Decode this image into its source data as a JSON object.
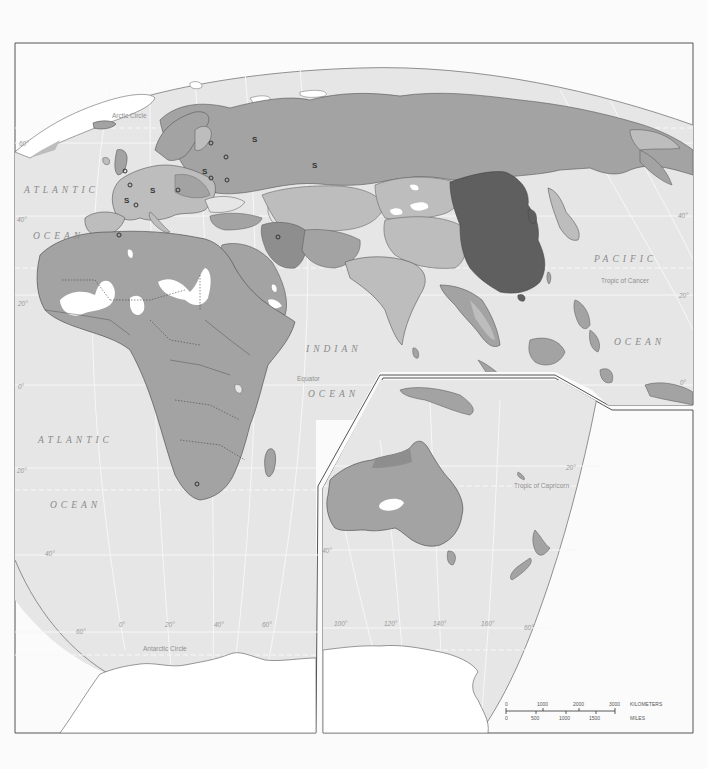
{
  "map": {
    "type": "thematic world map (Eastern Hemisphere, Europe/Africa/Asia/Australia)",
    "colors": {
      "page_bg": "#fbfbfb",
      "frame": "#555555",
      "ocean": "#e6e6e6",
      "graticule": "#f7f7f7",
      "land_light": "#bdbdbd",
      "land_medium": "#a3a3a3",
      "land_darker": "#8e8e8e",
      "land_darkest": "#5f5f5f",
      "ice": "#ffffff",
      "desert_blank": "#ffffff",
      "coast": "#555555"
    },
    "ocean_labels": [
      {
        "id": "atlantic-north-1",
        "text": "ATLANTIC"
      },
      {
        "id": "atlantic-north-2",
        "text": "OCEAN"
      },
      {
        "id": "atlantic-south-1",
        "text": "ATLANTIC"
      },
      {
        "id": "atlantic-south-2",
        "text": "OCEAN"
      },
      {
        "id": "indian-1",
        "text": "INDIAN"
      },
      {
        "id": "indian-2",
        "text": "OCEAN"
      },
      {
        "id": "pacific-1",
        "text": "PACIFIC"
      },
      {
        "id": "pacific-2",
        "text": "OCEAN"
      }
    ],
    "line_labels": {
      "arctic_circle": "Arctic Circle",
      "tropic_cancer": "Tropic of Cancer",
      "equator": "Equator",
      "tropic_capricorn": "Tropic of Capricorn",
      "antarctic_circle": "Antarctic Circle"
    },
    "latitude_labels": {
      "left_60": "60°",
      "left_40": "40°",
      "left_20": "20°",
      "left_0": "0°",
      "left_20s": "20°",
      "left_40s": "40°",
      "left_60s": "60°",
      "right_40": "40°",
      "right_20": "20°",
      "right_0": "0°",
      "right_20s": "20°",
      "inset_40s": "40°",
      "inset_60s": "60°"
    },
    "longitude_labels": {
      "lon_0": "0°",
      "lon_20": "20°",
      "lon_40": "40°",
      "lon_60": "60°",
      "lon_100": "100°",
      "lon_120": "120°",
      "lon_140": "140°",
      "lon_160": "160°"
    },
    "markers": {
      "s_symbol": "S",
      "o_symbol": "o"
    },
    "scale_bar": {
      "km_ticks": [
        "0",
        "1000",
        "2000",
        "3000"
      ],
      "km_unit": "KILOMETERS",
      "mi_ticks": [
        "0",
        "500",
        "1000",
        "1500"
      ],
      "mi_unit": "MILES"
    }
  }
}
